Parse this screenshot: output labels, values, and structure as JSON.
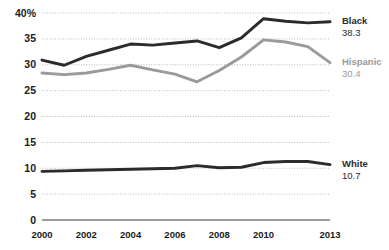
{
  "chart_data": {
    "type": "line",
    "title": "",
    "subtitle": "",
    "xlabel": "",
    "ylabel": "",
    "ylim": [
      0,
      40
    ],
    "xlim": [
      2000,
      2013
    ],
    "grid": true,
    "legend_position": "right-inline",
    "y_ticks": [
      "0",
      "5",
      "10",
      "15",
      "20",
      "25",
      "30",
      "35",
      "40%"
    ],
    "y_tick_values": [
      0,
      5,
      10,
      15,
      20,
      25,
      30,
      35,
      40
    ],
    "x_ticks": [
      "2000",
      "2002",
      "2004",
      "2006",
      "2008",
      "2010",
      "2013"
    ],
    "x_tick_values": [
      2000,
      2002,
      2004,
      2006,
      2008,
      2010,
      2013
    ],
    "x": [
      2000,
      2001,
      2002,
      2003,
      2004,
      2005,
      2006,
      2007,
      2008,
      2009,
      2010,
      2011,
      2012,
      2013
    ],
    "series": [
      {
        "name": "Black",
        "color": "#2b2b2b",
        "end_label": "Black",
        "end_value": "38.3",
        "values": [
          30.9,
          29.9,
          31.6,
          32.8,
          34.0,
          33.8,
          34.2,
          34.6,
          33.3,
          35.2,
          38.9,
          38.4,
          38.1,
          38.3
        ]
      },
      {
        "name": "Hispanic",
        "color": "#9a9a9a",
        "end_label": "Hispanic",
        "end_value": "30.4",
        "values": [
          28.4,
          28.1,
          28.4,
          29.1,
          29.9,
          29.0,
          28.2,
          26.7,
          28.9,
          31.5,
          34.8,
          34.4,
          33.5,
          30.4
        ]
      },
      {
        "name": "White",
        "color": "#2b2b2b",
        "end_label": "White",
        "end_value": "10.7",
        "values": [
          9.4,
          9.5,
          9.6,
          9.7,
          9.8,
          9.9,
          10.0,
          10.5,
          10.1,
          10.2,
          11.1,
          11.3,
          11.3,
          10.7
        ]
      }
    ]
  }
}
